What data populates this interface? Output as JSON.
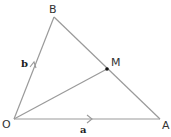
{
  "diagram": {
    "type": "triangle-vector-diagram",
    "points": {
      "O": {
        "label": "O",
        "x": 14,
        "y": 119
      },
      "A": {
        "label": "A",
        "x": 160,
        "y": 119
      },
      "B": {
        "label": "B",
        "x": 54,
        "y": 17
      },
      "M": {
        "label": "M",
        "x": 107,
        "y": 69
      }
    },
    "vectors": {
      "a": {
        "label": "a",
        "from": "O",
        "to": "A"
      },
      "b": {
        "label": "b",
        "from": "O",
        "to": "B"
      }
    },
    "segments": [
      "OA",
      "OB",
      "BA",
      "OM"
    ],
    "colors": {
      "line": "#9a9a9a",
      "text": "#333333",
      "point": "#111111"
    }
  }
}
